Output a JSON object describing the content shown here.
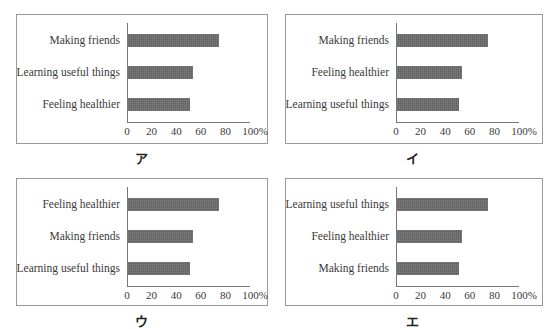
{
  "chart_data": [
    {
      "type": "bar",
      "orientation": "horizontal",
      "panel_label": "ア",
      "categories": [
        "Making friends",
        "Learning useful things",
        "Feeling healthier"
      ],
      "values": [
        74,
        53,
        50
      ],
      "xlabel": "",
      "ylabel": "",
      "xlim": [
        0,
        100
      ],
      "xticks": [
        "0",
        "20",
        "40",
        "60",
        "80",
        "100%"
      ],
      "grid": false
    },
    {
      "type": "bar",
      "orientation": "horizontal",
      "panel_label": "イ",
      "categories": [
        "Making friends",
        "Feeling healthier",
        "Learning useful things"
      ],
      "values": [
        74,
        53,
        50
      ],
      "xlabel": "",
      "ylabel": "",
      "xlim": [
        0,
        100
      ],
      "xticks": [
        "0",
        "20",
        "40",
        "60",
        "80",
        "100%"
      ],
      "grid": false
    },
    {
      "type": "bar",
      "orientation": "horizontal",
      "panel_label": "ウ",
      "categories": [
        "Feeling healthier",
        "Making friends",
        "Learning useful things"
      ],
      "values": [
        74,
        53,
        50
      ],
      "xlabel": "",
      "ylabel": "",
      "xlim": [
        0,
        100
      ],
      "xticks": [
        "0",
        "20",
        "40",
        "60",
        "80",
        "100%"
      ],
      "grid": false
    },
    {
      "type": "bar",
      "orientation": "horizontal",
      "panel_label": "エ",
      "categories": [
        "Learning useful things",
        "Feeling healthier",
        "Making friends"
      ],
      "values": [
        74,
        53,
        50
      ],
      "xlabel": "",
      "ylabel": "",
      "xlim": [
        0,
        100
      ],
      "xticks": [
        "0",
        "20",
        "40",
        "60",
        "80",
        "100%"
      ],
      "grid": false
    }
  ],
  "colors": {
    "bar": "#6b6b6b",
    "frame": "#9a9a9a",
    "axis": "#777777"
  }
}
